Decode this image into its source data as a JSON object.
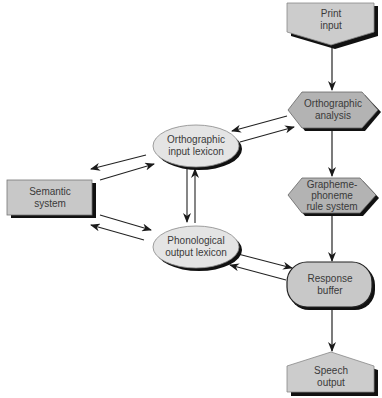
{
  "diagram": {
    "type": "dual-route reading model",
    "colors": {
      "box_fill": "#c8c8c8",
      "hex_fill": "#b3b3b3",
      "ellipse_fill": "#e4e4e4",
      "outline": "#333333",
      "shadow": "#111111",
      "text": "#3a3a3a",
      "arrow": "#222222"
    },
    "nodes": {
      "print_input": {
        "line1": "Print",
        "line2": "input",
        "shape": "pentagon-down"
      },
      "orthographic_analysis": {
        "line1": "Orthographic",
        "line2": "analysis",
        "shape": "hexagon"
      },
      "orthographic_input_lexicon": {
        "line1": "Orthographic",
        "line2": "input lexicon",
        "shape": "ellipse"
      },
      "semantic_system": {
        "line1": "Semantic",
        "line2": "system",
        "shape": "rectangle"
      },
      "grapheme_phoneme": {
        "line1": "Grapheme-",
        "line2": "phoneme",
        "line3": "rule system",
        "shape": "hexagon"
      },
      "phonological_output_lexicon": {
        "line1": "Phonological",
        "line2": "output lexicon",
        "shape": "ellipse"
      },
      "response_buffer": {
        "line1": "Response",
        "line2": "buffer",
        "shape": "rounded-rectangle"
      },
      "speech_output": {
        "line1": "Speech",
        "line2": "output",
        "shape": "pentagon-up"
      }
    },
    "edges": [
      {
        "from": "Print input",
        "to": "Orthographic analysis"
      },
      {
        "from": "Orthographic analysis",
        "to": "Grapheme-phoneme rule system"
      },
      {
        "from": "Grapheme-phoneme rule system",
        "to": "Response buffer"
      },
      {
        "from": "Response buffer",
        "to": "Speech output"
      },
      {
        "from": "Orthographic analysis",
        "to": "Orthographic input lexicon"
      },
      {
        "from": "Orthographic input lexicon",
        "to": "Orthographic analysis"
      },
      {
        "from": "Orthographic input lexicon",
        "to": "Semantic system"
      },
      {
        "from": "Semantic system",
        "to": "Orthographic input lexicon"
      },
      {
        "from": "Semantic system",
        "to": "Phonological output lexicon"
      },
      {
        "from": "Phonological output lexicon",
        "to": "Semantic system"
      },
      {
        "from": "Orthographic input lexicon",
        "to": "Phonological output lexicon"
      },
      {
        "from": "Phonological output lexicon",
        "to": "Orthographic input lexicon"
      },
      {
        "from": "Phonological output lexicon",
        "to": "Response buffer"
      },
      {
        "from": "Response buffer",
        "to": "Phonological output lexicon"
      }
    ]
  }
}
